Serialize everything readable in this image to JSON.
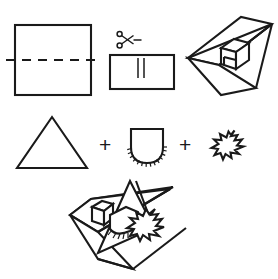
{
  "document": {
    "title": "Pop-up card construction diagram",
    "background_color": "#ffffff",
    "ink_color": "#1a1a1a",
    "width": 278,
    "height": 279
  },
  "rows": [
    {
      "name": "top-row",
      "steps": [
        {
          "id": "step-1",
          "label": "folded-card-with-fold-line",
          "description": "Square card panel with a horizontal dashed fold line across the middle extending past both edges",
          "shape": "square",
          "guide_line": "dashed-horizontal"
        },
        {
          "id": "step-2",
          "label": "cut-slit-with-scissors",
          "description": "Card panel with a pair of short parallel vertical cut lines in the centre, scissors icon above",
          "shape": "rectangle",
          "icon": "scissors-icon",
          "cut_marks": 2
        },
        {
          "id": "step-3",
          "label": "popped-up-box-card",
          "description": "Opened card in three-quarter view with a folded cube popping up from the fold",
          "shape": "open-card-3d",
          "popup": "box"
        }
      ]
    },
    {
      "name": "middle-row",
      "operator": "+",
      "steps": [
        {
          "id": "part-1",
          "label": "triangle-piece",
          "description": "Plain isoceles triangle cut-out"
        },
        {
          "id": "part-2",
          "label": "fringed-bucket-piece",
          "description": "U-shaped piece with radiating fringe cuts along the rounded bottom edge"
        },
        {
          "id": "part-3",
          "label": "fir-tree-piece",
          "description": "Small tilted fir tree cut-out"
        }
      ]
    },
    {
      "name": "bottom-row",
      "steps": [
        {
          "id": "result",
          "label": "assembled-popup-scene",
          "description": "Opened card in three-quarter view with the triangle, fringed bucket and fir tree assembled into a pop-up scene"
        }
      ]
    }
  ],
  "operators": {
    "plus_left": "+",
    "plus_right": "+"
  }
}
